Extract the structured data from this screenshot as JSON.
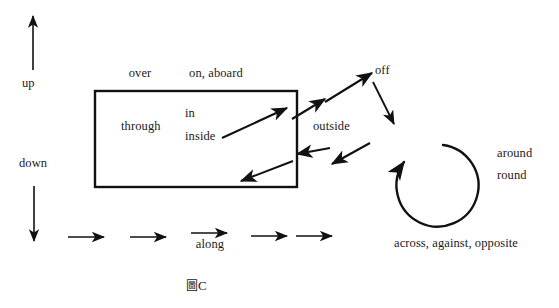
{
  "figure": {
    "caption": "圖C",
    "caption_cjk": "圖",
    "caption_suffix": "C",
    "background_color": "#ffffff",
    "ink_color": "#111111"
  },
  "labels": {
    "up": "up",
    "down": "down",
    "over": "over",
    "on_aboard": "on, aboard",
    "through": "through",
    "in": "in",
    "inside": "inside",
    "off": "off",
    "outside": "outside",
    "around": "around",
    "round": "round",
    "along": "along",
    "across_against_opposite": "across, against, opposite"
  },
  "shapes": {
    "box": {
      "name": "container-rectangle",
      "x": 95,
      "y": 91,
      "width": 202,
      "height": 96,
      "stroke": "#111111",
      "stroke_width": 2.4
    },
    "circle_arrow": {
      "name": "around-round-circular-arrow",
      "cx": 441,
      "cy": 186,
      "r": 41,
      "stroke": "#111111",
      "stroke_width": 2.4
    }
  },
  "arrows": {
    "up_arrow": {
      "x1": 33,
      "y1": 70,
      "x2": 33,
      "y2": 14
    },
    "down_arrow": {
      "x1": 34,
      "y1": 186,
      "x2": 34,
      "y2": 243
    },
    "in_arrow": {
      "x1": 222,
      "y1": 137,
      "x2": 286,
      "y2": 108
    },
    "out_through_arrow": {
      "x1": 295,
      "y1": 115,
      "x2": 322,
      "y2": 98
    },
    "off_up_arrow": {
      "x1": 322,
      "y1": 105,
      "x2": 371,
      "y2": 74
    },
    "off_down_arrow": {
      "x1": 372,
      "y1": 82,
      "x2": 394,
      "y2": 123
    },
    "outside_back_arrow": {
      "x1": 367,
      "y1": 147,
      "x2": 300,
      "y2": 155
    },
    "exit_bottom_arrow": {
      "x1": 292,
      "y1": 161,
      "x2": 242,
      "y2": 181
    },
    "along_arrows": [
      {
        "x1": 68,
        "y1": 237,
        "x2": 106,
        "y2": 237
      },
      {
        "x1": 130,
        "y1": 237,
        "x2": 168,
        "y2": 237
      },
      {
        "x1": 191,
        "y1": 234,
        "x2": 229,
        "y2": 234
      },
      {
        "x1": 251,
        "y1": 237,
        "x2": 289,
        "y2": 237
      },
      {
        "x1": 296,
        "y1": 237,
        "x2": 334,
        "y2": 237
      }
    ]
  },
  "label_positions": {
    "up": {
      "x": 22,
      "y": 76
    },
    "down": {
      "x": 19,
      "y": 156
    },
    "over": {
      "x": 140,
      "y": 67
    },
    "on_aboard": {
      "x": 216,
      "y": 67
    },
    "through": {
      "x": 146,
      "y": 120
    },
    "in": {
      "x": 184,
      "y": 108
    },
    "inside": {
      "x": 184,
      "y": 131
    },
    "off": {
      "x": 386,
      "y": 63
    },
    "outside": {
      "x": 338,
      "y": 119
    },
    "around": {
      "x": 522,
      "y": 147
    },
    "round": {
      "x": 522,
      "y": 169
    },
    "along": {
      "x": 210,
      "y": 238
    },
    "across": {
      "x": 456,
      "y": 236
    },
    "caption": {
      "x": 202,
      "y": 276
    }
  }
}
